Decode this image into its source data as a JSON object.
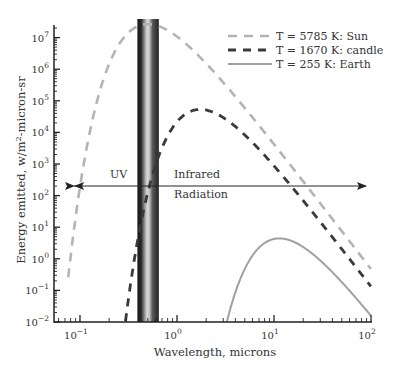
{
  "chart_data": {
    "type": "line",
    "title": "",
    "xlabel": "Wavelength, microns",
    "ylabel": "Energy emitted, w/m²-micron-sr",
    "xscale": "log",
    "yscale": "log",
    "xlim": [
      0.054,
      100
    ],
    "ylim": [
      0.01,
      20000000
    ],
    "x_ticks": [
      {
        "value": 0.1,
        "base": "10",
        "exp": "−1"
      },
      {
        "value": 1,
        "base": "10",
        "exp": "0"
      },
      {
        "value": 10,
        "base": "10",
        "exp": "1"
      },
      {
        "value": 100,
        "base": "10",
        "exp": "2"
      }
    ],
    "y_ticks": [
      {
        "value": 0.01,
        "base": "10",
        "exp": "−2"
      },
      {
        "value": 0.1,
        "base": "10",
        "exp": "−1"
      },
      {
        "value": 1,
        "base": "10",
        "exp": "0"
      },
      {
        "value": 10,
        "base": "10",
        "exp": "1"
      },
      {
        "value": 100,
        "base": "10",
        "exp": "2"
      },
      {
        "value": 1000,
        "base": "10",
        "exp": "3"
      },
      {
        "value": 10000,
        "base": "10",
        "exp": "4"
      },
      {
        "value": 100000,
        "base": "10",
        "exp": "5"
      },
      {
        "value": 1000000,
        "base": "10",
        "exp": "6"
      },
      {
        "value": 10000000,
        "base": "10",
        "exp": "7"
      }
    ],
    "grid": false,
    "legend_position": "upper right",
    "series": [
      {
        "name": "T = 5785 K: Sun",
        "temperature_K": 5785,
        "style": "dashed",
        "color": "#b4b4b4",
        "width": 2.6,
        "dash": "9,7",
        "x": [
          0.07,
          0.1,
          0.2,
          0.3,
          0.5,
          1.0,
          2.0,
          5.0,
          10,
          30,
          100
        ],
        "values": [
          0.02,
          80,
          2100000.0,
          14000000.0,
          26000000.0,
          8500000.0,
          900000.0,
          30000.0,
          2000.0,
          26.0,
          0.22
        ]
      },
      {
        "name": "T = 1670 K: candle",
        "temperature_K": 1670,
        "style": "dashed",
        "color": "#3a3a3a",
        "width": 2.8,
        "dash": "8,7",
        "x": [
          0.3,
          0.4,
          0.5,
          1.0,
          1.7,
          3.0,
          5.0,
          10,
          30,
          100
        ],
        "values": [
          0.01,
          1.1,
          190.0,
          22000.0,
          46000.0,
          23000.0,
          6000.0,
          600.0,
          8.0,
          0.07
        ]
      },
      {
        "name": "T = 255 K: Earth",
        "temperature_K": 255,
        "style": "solid",
        "color": "#a0a0a0",
        "width": 2,
        "x": [
          3.3,
          5,
          8,
          11.4,
          20,
          40,
          100
        ],
        "values": [
          0.01,
          0.33,
          2.5,
          3.9,
          2.6,
          0.6,
          0.02
        ]
      }
    ],
    "annotations": [
      {
        "text": "UV",
        "x": 0.13,
        "y": 250
      },
      {
        "text": "Infrared",
        "x": 1.8,
        "y": 250
      },
      {
        "text": "Radiation",
        "x": 1.8,
        "y": 60
      },
      {
        "type": "double-arrow",
        "from": 0.055,
        "to": 90,
        "y": 160
      },
      {
        "type": "visible-band",
        "from": 0.4,
        "to": 0.65
      }
    ]
  }
}
